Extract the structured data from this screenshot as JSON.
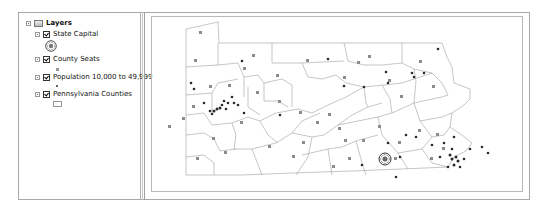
{
  "toc": {
    "root_label": "Layers",
    "layers": [
      {
        "label": "State Capital",
        "checked": true,
        "symbol": "capital-star-circle-icon"
      },
      {
        "label": "County Seats",
        "checked": true,
        "symbol": "gray-square-point-icon"
      },
      {
        "label": "Population 10,000 to 49,999",
        "checked": true,
        "symbol": "black-dot-point-icon"
      },
      {
        "label": "Pennsylvania Counties",
        "checked": true,
        "symbol": "hollow-polygon-icon"
      }
    ]
  },
  "map": {
    "title": "Pennsylvania",
    "colors": {
      "county_outline": "#9a9a9a",
      "county_seat": "#8c8c8c",
      "population_point": "#2a2a2a",
      "capital": "#444444"
    }
  }
}
